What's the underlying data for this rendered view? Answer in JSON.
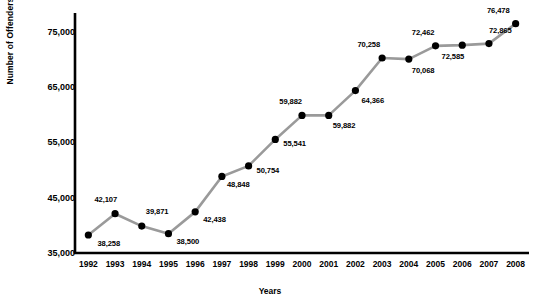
{
  "chart_data": {
    "type": "line",
    "title": "",
    "xlabel": "Years",
    "ylabel": "Number of Offenders",
    "categories": [
      "1992",
      "1993",
      "1994",
      "1995",
      "1996",
      "1997",
      "1998",
      "1999",
      "2000",
      "2001",
      "2002",
      "2003",
      "2004",
      "2005",
      "2006",
      "2007",
      "2008"
    ],
    "values": [
      38258,
      42107,
      39871,
      38500,
      42438,
      48848,
      50754,
      55541,
      59882,
      59882,
      64366,
      70258,
      70068,
      72462,
      72585,
      72865,
      76478
    ],
    "point_labels": [
      "38,258",
      "42,107",
      "39,871",
      "38,500",
      "42,438",
      "48,848",
      "50,754",
      "55,541",
      "59,882",
      "59,882",
      "64,366",
      "70,258",
      "70,068",
      "72,462",
      "72,585",
      "72,865",
      "76,478"
    ],
    "ytick_labels": [
      "35,000",
      "45,000",
      "55,000",
      "65,000",
      "75,000"
    ],
    "yticks": [
      35000,
      45000,
      55000,
      65000,
      75000
    ],
    "ylim": [
      35000,
      78400
    ],
    "grid": false,
    "legend": null,
    "series_name": "Number of Offenders",
    "line_color": "#9a9a9a",
    "marker_color": "#000000",
    "axis_color": "#000000"
  },
  "label_offsets": [
    {
      "dx": 9,
      "dy": 9
    },
    {
      "dx": -2,
      "dy": -14
    },
    {
      "dx": 4,
      "dy": -14
    },
    {
      "dx": 8,
      "dy": 8
    },
    {
      "dx": 8,
      "dy": 8
    },
    {
      "dx": 5,
      "dy": 9
    },
    {
      "dx": 8,
      "dy": 5
    },
    {
      "dx": 8,
      "dy": 5
    },
    {
      "dx": -4,
      "dy": -13
    },
    {
      "dx": 4,
      "dy": 11
    },
    {
      "dx": 6,
      "dy": 10
    },
    {
      "dx": -6,
      "dy": -13
    },
    {
      "dx": 3,
      "dy": 12
    },
    {
      "dx": -5,
      "dy": -13
    },
    {
      "dx": -2,
      "dy": 12
    },
    {
      "dx": 0,
      "dy": -13
    },
    {
      "dx": -10,
      "dy": -13
    }
  ]
}
